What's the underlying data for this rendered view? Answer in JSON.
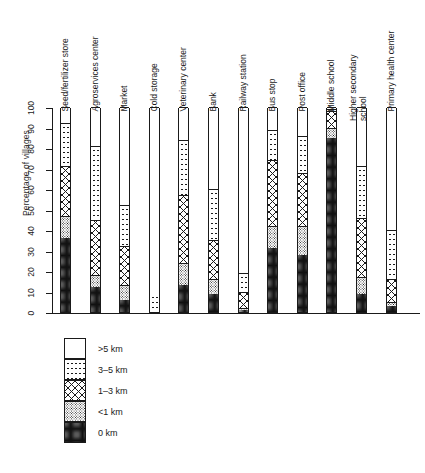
{
  "chart_data": {
    "type": "bar",
    "subtype": "stacked-vertical-100pct",
    "title": "",
    "xlabel": "",
    "ylabel": "Percentage of villages",
    "ylim": [
      0,
      100
    ],
    "yticks": [
      0,
      10,
      20,
      30,
      40,
      50,
      60,
      70,
      80,
      90,
      100
    ],
    "grid": false,
    "legend_position": "below-left",
    "categories": [
      "Seed/fertilizer store",
      "Agroservices center",
      "Market",
      "Cold storage",
      "Veterinary center",
      "Bank",
      "Railway station",
      "Bus stop",
      "Post office",
      "Middle school",
      "Higher secondary school",
      "Primary health center"
    ],
    "series": [
      {
        "name": "0 km",
        "pattern": "dense-dark-stipple",
        "values": [
          36,
          12,
          6,
          0,
          13,
          9,
          1,
          31,
          28,
          85,
          9,
          3
        ]
      },
      {
        "name": "<1 km",
        "pattern": "fine-stipple",
        "values": [
          11,
          6,
          7,
          0,
          11,
          7,
          1,
          11,
          14,
          5,
          8,
          2
        ]
      },
      {
        "name": "1–3 km",
        "pattern": "cross-hatch",
        "values": [
          24,
          27,
          19,
          0,
          33,
          19,
          8,
          32,
          26,
          8,
          29,
          11
        ]
      },
      {
        "name": "3–5 km",
        "pattern": "sparse-dots",
        "values": [
          21,
          36,
          20,
          9,
          27,
          25,
          9,
          15,
          18,
          1,
          25,
          24
        ]
      },
      {
        "name": ">5 km",
        "pattern": "plain-white",
        "values": [
          8,
          19,
          48,
          91,
          16,
          40,
          81,
          11,
          14,
          1,
          29,
          60
        ]
      }
    ]
  },
  "legend": {
    "items": [
      {
        "label": ">5 km",
        "pattern": "pat-gt5"
      },
      {
        "label": "3–5 km",
        "pattern": "pat-3-5"
      },
      {
        "label": "1–3 km",
        "pattern": "pat-1-3"
      },
      {
        "label": "<1 km",
        "pattern": "pat-lt1"
      },
      {
        "label": "0 km",
        "pattern": "pat-0"
      }
    ]
  },
  "axis": {
    "y_title": "Percentage of villages",
    "tick_labels": [
      "0",
      "10",
      "20",
      "30",
      "40",
      "50",
      "60",
      "70",
      "80",
      "90",
      "100"
    ]
  },
  "colors": {
    "ink": "#1a1a1a",
    "paper": "#ffffff"
  }
}
